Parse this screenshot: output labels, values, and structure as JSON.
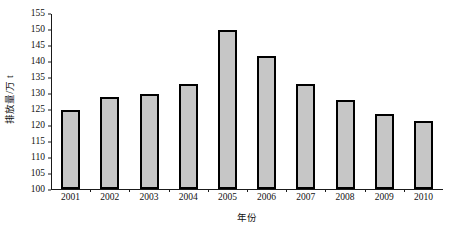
{
  "chart_data": {
    "type": "bar",
    "title": "",
    "xlabel": "年份",
    "ylabel": "排放量/万 t",
    "categories": [
      "2001",
      "2002",
      "2003",
      "2004",
      "2005",
      "2006",
      "2007",
      "2008",
      "2009",
      "2010"
    ],
    "values": [
      125,
      129,
      130,
      133,
      150,
      142,
      133,
      128,
      123.5,
      121.5
    ],
    "ylim": [
      100,
      155
    ],
    "ytick_labels": [
      "100",
      "105",
      "110",
      "115",
      "120",
      "125",
      "130",
      "135",
      "140",
      "145",
      "150",
      "155"
    ],
    "ytick_values": [
      100,
      105,
      110,
      115,
      120,
      125,
      130,
      135,
      140,
      145,
      150,
      155
    ],
    "ytick_step": 5,
    "grid": false,
    "legend": null,
    "bar_fill_color": "#c6c6c6",
    "bar_edge_color": "#000000",
    "axis_color": "#1a1a1a",
    "background_color": "#ffffff"
  }
}
